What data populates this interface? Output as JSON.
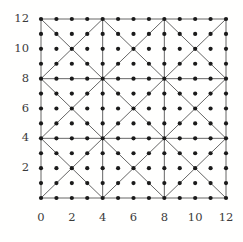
{
  "chart_data": {
    "type": "scatter",
    "title": "",
    "subtitle": "",
    "xlabel": "",
    "ylabel": "",
    "xlim": [
      0,
      12
    ],
    "ylim": [
      0,
      12
    ],
    "grid": true,
    "legend": null,
    "x_tick_labels": [
      "0",
      "2",
      "4",
      "6",
      "8",
      "10",
      "12"
    ],
    "x_tick_values": [
      0,
      2,
      4,
      6,
      8,
      10,
      12
    ],
    "y_tick_labels": [
      "2",
      "4",
      "6",
      "8",
      "10",
      "12"
    ],
    "y_tick_values": [
      2,
      4,
      6,
      8,
      10,
      12
    ],
    "lattice": {
      "x_min": 0,
      "x_max": 12,
      "y_min": 0,
      "y_max": 12,
      "step": 1,
      "point_count": 169,
      "marker": "filled-circle",
      "marker_color": "#1a1a1a",
      "marker_radius_px": 2.1
    },
    "mesh": {
      "cell_size": 4,
      "cells_per_side": 3,
      "line_color": "#555555",
      "line_width_px": 0.9,
      "grid_line_positions": [
        0,
        4,
        8,
        12
      ],
      "diagonals": "both-per-cell"
    },
    "series": [
      {
        "name": "lattice points",
        "points_x": [
          0,
          1,
          2,
          3,
          4,
          5,
          6,
          7,
          8,
          9,
          10,
          11,
          12
        ],
        "points_y": [
          0,
          1,
          2,
          3,
          4,
          5,
          6,
          7,
          8,
          9,
          10,
          11,
          12
        ],
        "note": "full Cartesian product of points_x and points_y"
      }
    ]
  },
  "axes": {
    "plot_left_px": 41,
    "plot_top_px": 19,
    "plot_right_px": 226,
    "plot_bottom_px": 198
  },
  "colors": {
    "background": "#fffffe",
    "mesh": "#555555",
    "dot": "#1a1a1a",
    "tick_text": "#3b3b3b"
  }
}
